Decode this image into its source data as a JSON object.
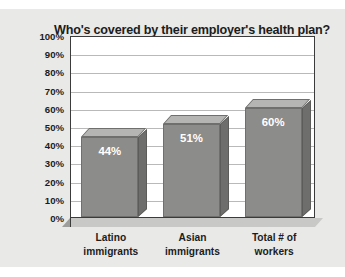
{
  "chart_data": {
    "type": "bar",
    "title": "Who's covered by their employer's health plan?",
    "categories": [
      "Latino immigrants",
      "Asian immigrants",
      "Total # of workers"
    ],
    "category_lines": [
      [
        "Latino",
        "immigrants"
      ],
      [
        "Asian",
        "immigrants"
      ],
      [
        "Total # of",
        "workers"
      ]
    ],
    "values": [
      44,
      51,
      60
    ],
    "value_labels": [
      "44%",
      "51%",
      "60%"
    ],
    "xlabel": "",
    "ylabel": "",
    "ylim": [
      0,
      100
    ],
    "ytick_step": 10,
    "ytick_labels": [
      "100%",
      "90%",
      "80%",
      "70%",
      "60%",
      "50%",
      "40%",
      "30%",
      "20%",
      "10%",
      "0%"
    ],
    "ytick_values": [
      100,
      90,
      80,
      70,
      60,
      50,
      40,
      30,
      20,
      10,
      0
    ],
    "grid": true,
    "legend": false,
    "style": "3d-column",
    "colors": {
      "bar_front": "#8c8c8a",
      "bar_top": "#b5b5b3",
      "bar_side": "#6e6e6c",
      "plot_background": "#ffffff",
      "figure_background": "#e9e9e7",
      "gridline": "#b9b9b9",
      "axis": "#3b3b3b",
      "value_label": "#ffffff",
      "text": "#1c1c1c"
    }
  }
}
